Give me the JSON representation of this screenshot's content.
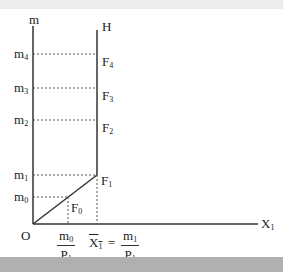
{
  "diagram": {
    "axes": {
      "y_label": "m",
      "x_label_base": "X",
      "x_label_sub": "1",
      "origin_label": "O",
      "vertical_line_label": "H"
    },
    "y_levels": [
      {
        "base": "m",
        "sub": "4",
        "point_base": "F",
        "point_sub": "4"
      },
      {
        "base": "m",
        "sub": "3",
        "point_base": "F",
        "point_sub": "3"
      },
      {
        "base": "m",
        "sub": "2",
        "point_base": "F",
        "point_sub": "2"
      },
      {
        "base": "m",
        "sub": "1",
        "point_base": "F",
        "point_sub": "1"
      },
      {
        "base": "m",
        "sub": "0",
        "point_base": "F",
        "point_sub": "0"
      }
    ],
    "x_ticks": {
      "first": {
        "num_base": "m",
        "num_sub": "0",
        "den_base": "P",
        "den_sub": "1"
      },
      "second": {
        "lhs_base": "X",
        "lhs_sub": "1",
        "equals": "=",
        "num_base": "m",
        "num_sub": "1",
        "den_base": "P",
        "den_sub": "1"
      }
    },
    "colors": {
      "line": "#333333",
      "dashed": "#555555",
      "top_band": "#ececec",
      "bottom_band": "#b0b0b0"
    }
  }
}
